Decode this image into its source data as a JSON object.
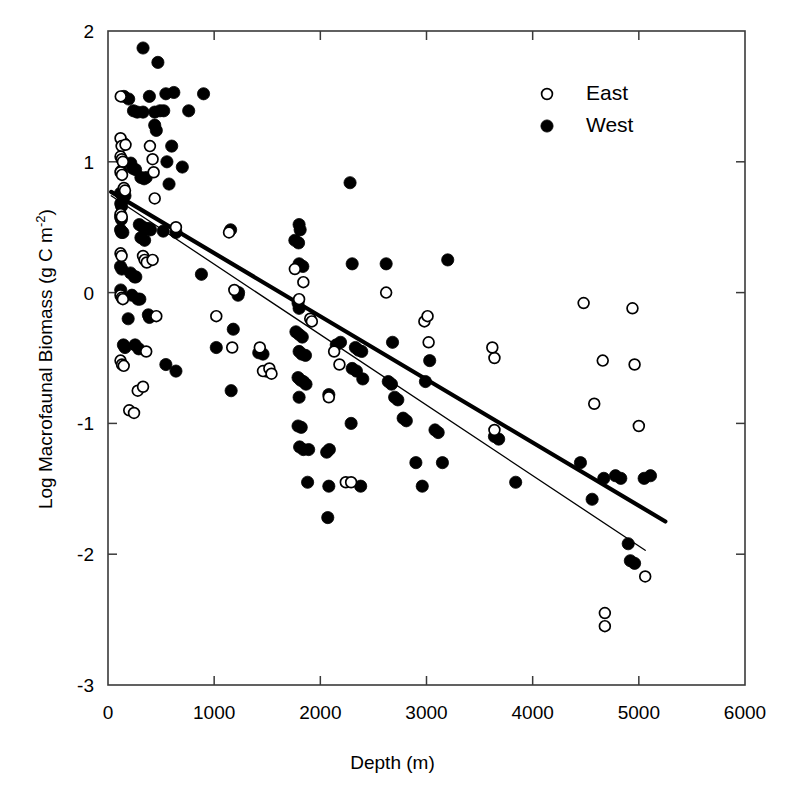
{
  "chart_data": {
    "type": "scatter",
    "title": "",
    "xlabel": "Depth (m)",
    "ylabel_plain": "Log Macrofaunal Biomass (g C m-2)",
    "ylabel_main": "Log Macrofaunal Biomass (g C m",
    "ylabel_exponent": "-2",
    "ylabel_close": ")",
    "xlim": [
      0,
      6000
    ],
    "ylim": [
      -3,
      2
    ],
    "xticks": [
      0,
      1000,
      2000,
      3000,
      4000,
      5000,
      6000
    ],
    "yticks": [
      2,
      1,
      0,
      -1,
      -2,
      -3
    ],
    "xtick_labels": [
      "0",
      "1000",
      "2000",
      "3000",
      "4000",
      "5000",
      "6000"
    ],
    "ytick_labels": [
      "2",
      "1",
      "0",
      "-1",
      "-2",
      "-3"
    ],
    "grid": false,
    "frame": "box",
    "tick_direction": "in",
    "legend": {
      "position": "top-right",
      "entries": [
        {
          "label": "East",
          "marker": "open-circle",
          "color": "#000000"
        },
        {
          "label": "West",
          "marker": "filled-circle",
          "color": "#000000"
        }
      ]
    },
    "trendlines": [
      {
        "name": "West",
        "style": "thick",
        "width": 4.2,
        "color": "#000000",
        "x0": 30,
        "y0": 0.77,
        "x1": 5250,
        "y1": -1.75
      },
      {
        "name": "East",
        "style": "thin",
        "width": 1.3,
        "color": "#000000",
        "x0": 30,
        "y0": 0.74,
        "x1": 5060,
        "y1": -1.97
      }
    ],
    "series": [
      {
        "name": "West",
        "marker": "filled-circle",
        "color": "#000000",
        "points": [
          [
            330,
            1.87
          ],
          [
            470,
            1.76
          ],
          [
            150,
            1.5
          ],
          [
            195,
            1.48
          ],
          [
            390,
            1.5
          ],
          [
            545,
            1.52
          ],
          [
            620,
            1.53
          ],
          [
            240,
            1.39
          ],
          [
            275,
            1.38
          ],
          [
            330,
            1.38
          ],
          [
            440,
            1.38
          ],
          [
            490,
            1.39
          ],
          [
            525,
            1.39
          ],
          [
            440,
            1.28
          ],
          [
            455,
            1.24
          ],
          [
            600,
            1.12
          ],
          [
            150,
            1.14
          ],
          [
            555,
            1.0
          ],
          [
            215,
            0.99
          ],
          [
            235,
            0.95
          ],
          [
            260,
            0.94
          ],
          [
            125,
            0.93
          ],
          [
            310,
            0.88
          ],
          [
            340,
            0.87
          ],
          [
            360,
            0.88
          ],
          [
            575,
            0.83
          ],
          [
            118,
            0.76
          ],
          [
            130,
            0.76
          ],
          [
            140,
            0.75
          ],
          [
            150,
            0.74
          ],
          [
            160,
            0.74
          ],
          [
            120,
            0.68
          ],
          [
            128,
            0.66
          ],
          [
            118,
            0.58
          ],
          [
            126,
            0.56
          ],
          [
            118,
            0.48
          ],
          [
            128,
            0.46
          ],
          [
            140,
            0.46
          ],
          [
            295,
            0.52
          ],
          [
            330,
            0.5
          ],
          [
            360,
            0.49
          ],
          [
            385,
            0.49
          ],
          [
            400,
            0.48
          ],
          [
            310,
            0.42
          ],
          [
            345,
            0.4
          ],
          [
            118,
            0.2
          ],
          [
            130,
            0.18
          ],
          [
            212,
            0.15
          ],
          [
            250,
            0.12
          ],
          [
            262,
            0.12
          ],
          [
            225,
            -0.02
          ],
          [
            282,
            -0.05
          ],
          [
            300,
            -0.05
          ],
          [
            120,
            0.02
          ],
          [
            190,
            -0.2
          ],
          [
            380,
            -0.17
          ],
          [
            390,
            -0.19
          ],
          [
            145,
            -0.4
          ],
          [
            160,
            -0.42
          ],
          [
            255,
            -0.4
          ],
          [
            290,
            -0.43
          ],
          [
            545,
            -0.55
          ],
          [
            640,
            -0.6
          ],
          [
            1155,
            0.48
          ],
          [
            1225,
            -0.02
          ],
          [
            1230,
            0.0
          ],
          [
            1180,
            -0.28
          ],
          [
            1160,
            -0.75
          ],
          [
            1420,
            -0.46
          ],
          [
            1460,
            -0.47
          ],
          [
            1490,
            -0.6
          ],
          [
            1800,
            0.52
          ],
          [
            1810,
            0.48
          ],
          [
            1760,
            0.4
          ],
          [
            1795,
            0.38
          ],
          [
            1800,
            0.22
          ],
          [
            1835,
            0.2
          ],
          [
            1790,
            -0.08
          ],
          [
            1800,
            -0.12
          ],
          [
            1770,
            -0.3
          ],
          [
            1800,
            -0.32
          ],
          [
            1830,
            -0.34
          ],
          [
            1800,
            -0.45
          ],
          [
            1825,
            -0.47
          ],
          [
            1860,
            -0.48
          ],
          [
            1790,
            -0.65
          ],
          [
            1815,
            -0.67
          ],
          [
            1840,
            -0.68
          ],
          [
            1865,
            -0.7
          ],
          [
            1800,
            -0.8
          ],
          [
            1790,
            -1.02
          ],
          [
            1820,
            -1.03
          ],
          [
            1805,
            -1.18
          ],
          [
            1840,
            -1.2
          ],
          [
            1880,
            -1.45
          ],
          [
            2060,
            -1.22
          ],
          [
            2085,
            -1.2
          ],
          [
            2070,
            -1.72
          ],
          [
            2080,
            -0.78
          ],
          [
            2150,
            -0.4
          ],
          [
            2190,
            -0.38
          ],
          [
            2280,
            0.84
          ],
          [
            2300,
            0.22
          ],
          [
            2330,
            -0.42
          ],
          [
            2360,
            -0.44
          ],
          [
            2390,
            -0.45
          ],
          [
            2300,
            -0.58
          ],
          [
            2340,
            -0.6
          ],
          [
            2400,
            -0.66
          ],
          [
            2290,
            -1.0
          ],
          [
            2380,
            -1.48
          ],
          [
            2620,
            0.22
          ],
          [
            2680,
            -0.38
          ],
          [
            2640,
            -0.68
          ],
          [
            2670,
            -0.7
          ],
          [
            2700,
            -0.8
          ],
          [
            2730,
            -0.82
          ],
          [
            2780,
            -0.96
          ],
          [
            2810,
            -0.98
          ],
          [
            2900,
            -1.3
          ],
          [
            2960,
            -1.48
          ],
          [
            2990,
            -0.68
          ],
          [
            3030,
            -0.52
          ],
          [
            3080,
            -1.05
          ],
          [
            3110,
            -1.07
          ],
          [
            3150,
            -1.3
          ],
          [
            3200,
            0.25
          ],
          [
            3640,
            -1.1
          ],
          [
            3680,
            -1.12
          ],
          [
            3840,
            -1.45
          ],
          [
            4560,
            -1.58
          ],
          [
            4670,
            -1.42
          ],
          [
            4780,
            -1.4
          ],
          [
            4830,
            -1.42
          ],
          [
            4900,
            -1.92
          ],
          [
            4920,
            -2.05
          ],
          [
            4960,
            -2.07
          ],
          [
            5050,
            -1.42
          ],
          [
            5110,
            -1.4
          ],
          [
            4450,
            -1.3
          ],
          [
            2080,
            -1.48
          ],
          [
            1890,
            -1.2
          ],
          [
            900,
            1.52
          ],
          [
            760,
            1.39
          ],
          [
            700,
            0.96
          ],
          [
            520,
            0.47
          ],
          [
            640,
            0.46
          ],
          [
            880,
            0.14
          ],
          [
            1020,
            -0.42
          ]
        ]
      },
      {
        "name": "East",
        "marker": "open-circle",
        "color": "#000000",
        "points": [
          [
            120,
            1.5
          ],
          [
            118,
            1.18
          ],
          [
            128,
            1.12
          ],
          [
            165,
            1.13
          ],
          [
            395,
            1.12
          ],
          [
            420,
            1.02
          ],
          [
            430,
            0.92
          ],
          [
            118,
            1.04
          ],
          [
            130,
            1.02
          ],
          [
            140,
            1.0
          ],
          [
            118,
            0.92
          ],
          [
            132,
            0.9
          ],
          [
            150,
            0.8
          ],
          [
            160,
            0.78
          ],
          [
            440,
            0.72
          ],
          [
            118,
            0.6
          ],
          [
            130,
            0.58
          ],
          [
            118,
            0.3
          ],
          [
            128,
            0.28
          ],
          [
            330,
            0.28
          ],
          [
            345,
            0.25
          ],
          [
            365,
            0.23
          ],
          [
            420,
            0.25
          ],
          [
            118,
            -0.02
          ],
          [
            130,
            -0.04
          ],
          [
            140,
            -0.05
          ],
          [
            455,
            -0.18
          ],
          [
            360,
            -0.45
          ],
          [
            118,
            -0.52
          ],
          [
            132,
            -0.55
          ],
          [
            148,
            -0.56
          ],
          [
            280,
            -0.75
          ],
          [
            330,
            -0.72
          ],
          [
            200,
            -0.9
          ],
          [
            245,
            -0.92
          ],
          [
            1170,
            -0.42
          ],
          [
            1430,
            -0.42
          ],
          [
            1460,
            -0.6
          ],
          [
            1520,
            -0.58
          ],
          [
            1540,
            -0.62
          ],
          [
            1800,
            -0.05
          ],
          [
            1840,
            0.08
          ],
          [
            1760,
            0.18
          ],
          [
            1905,
            -0.2
          ],
          [
            1920,
            -0.22
          ],
          [
            2080,
            -0.8
          ],
          [
            2130,
            -0.45
          ],
          [
            2180,
            -0.55
          ],
          [
            2240,
            -1.45
          ],
          [
            2290,
            -1.45
          ],
          [
            2980,
            -0.22
          ],
          [
            3010,
            -0.18
          ],
          [
            3020,
            -0.38
          ],
          [
            3640,
            -1.05
          ],
          [
            4480,
            -0.08
          ],
          [
            4660,
            -0.52
          ],
          [
            4580,
            -0.85
          ],
          [
            4940,
            -0.12
          ],
          [
            4960,
            -0.55
          ],
          [
            5000,
            -1.02
          ],
          [
            5060,
            -2.17
          ],
          [
            4680,
            -2.45
          ],
          [
            4680,
            -2.55
          ],
          [
            3640,
            -0.5
          ],
          [
            3620,
            -0.42
          ],
          [
            2620,
            0.0
          ],
          [
            1190,
            0.02
          ],
          [
            1140,
            0.46
          ],
          [
            640,
            0.5
          ],
          [
            1020,
            -0.18
          ]
        ]
      }
    ]
  }
}
